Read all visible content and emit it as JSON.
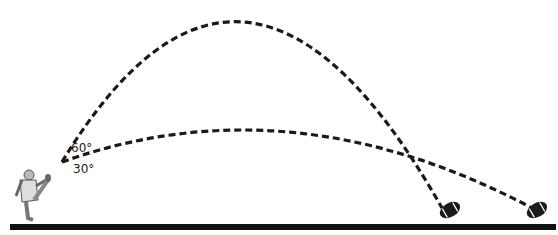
{
  "diagram": {
    "angles": [
      {
        "label": "60°",
        "trajectory": "high-arc"
      },
      {
        "label": "30°",
        "trajectory": "low-arc"
      }
    ],
    "labels": {
      "angle_high": "60°",
      "angle_low": "30°"
    },
    "colors": {
      "line": "#1a1a1a",
      "ground": "#111111",
      "ball": "#1a1a1a"
    }
  }
}
